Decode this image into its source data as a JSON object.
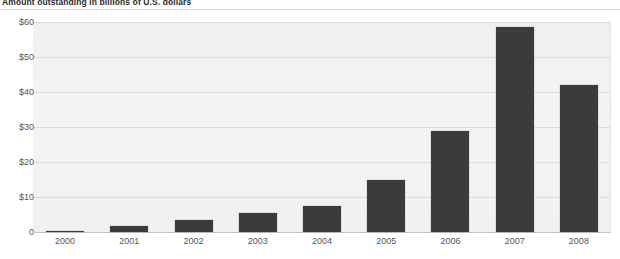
{
  "chart_data": {
    "type": "bar",
    "title": "Amount outstanding in billions of U.S. dollars",
    "xlabel": "",
    "ylabel": "",
    "categories": [
      "2000",
      "2001",
      "2002",
      "2003",
      "2004",
      "2005",
      "2006",
      "2007",
      "2008"
    ],
    "values": [
      0.3,
      1.7,
      3.5,
      5.4,
      7.5,
      14.8,
      28.8,
      58.5,
      42.0
    ],
    "ylim": [
      0,
      60
    ],
    "ytick_values": [
      0,
      10,
      20,
      30,
      40,
      50,
      60
    ],
    "ytick_labels": [
      "0",
      "$10",
      "$20",
      "$30",
      "$40",
      "$50",
      "$60"
    ],
    "grid": true,
    "legend": false,
    "bar_color": "#3b3b3b",
    "plot_background": "#f2f2f2",
    "gridline_color": "#dcdcdc"
  }
}
